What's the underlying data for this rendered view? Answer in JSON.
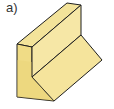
{
  "figure": {
    "label": "a)",
    "colors": {
      "top_face": "#f3e39a",
      "left_face": "#f0dc86",
      "front_wall_face": "#f6e7a6",
      "slope_face": "#f5e49c",
      "right_face": "#eed77e",
      "edge": "#1f1f1f"
    }
  }
}
